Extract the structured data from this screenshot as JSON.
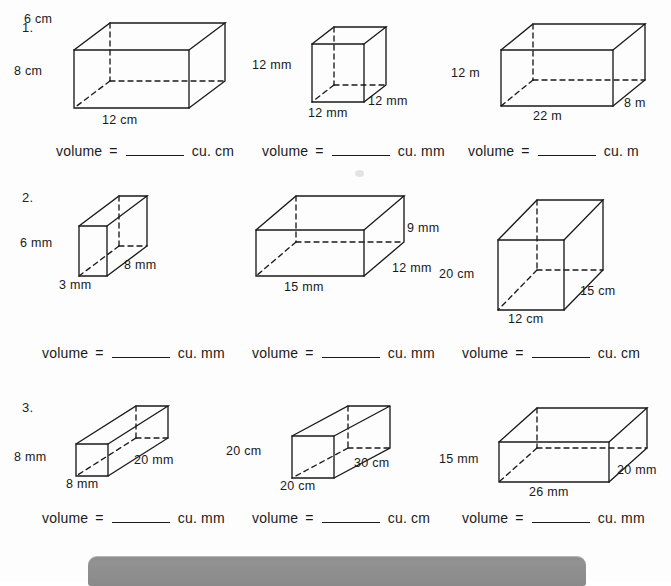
{
  "worksheet": {
    "title": "Volume of rectangular prisms worksheet",
    "ink_color": "#1a1a1a",
    "paper_color": "#fdfdfd",
    "accent_color": "#8e8e8e"
  },
  "problems": [
    {
      "number": "1.",
      "items": [
        {
          "shape": "rectangular-prism",
          "labels": {
            "height": "8 cm",
            "depth": "6 cm",
            "width": "12 cm"
          },
          "volume": {
            "word": "volume",
            "equals": "=",
            "blank": "",
            "unit": "cu. cm"
          }
        },
        {
          "shape": "cube",
          "labels": {
            "height": "12 mm",
            "depth": "12 mm",
            "width": "12 mm"
          },
          "volume": {
            "word": "volume",
            "equals": "=",
            "blank": "",
            "unit": "cu. mm"
          }
        },
        {
          "shape": "rectangular-prism",
          "labels": {
            "height": "12 m",
            "depth": "8 m",
            "width": "22 m"
          },
          "volume": {
            "word": "volume",
            "equals": "=",
            "blank": "",
            "unit": "cu. m"
          }
        }
      ]
    },
    {
      "number": "2.",
      "items": [
        {
          "shape": "rectangular-prism",
          "labels": {
            "height": "6 mm",
            "depth": "8 mm",
            "width": "3 mm"
          },
          "volume": {
            "word": "volume",
            "equals": "=",
            "blank": "",
            "unit": "cu. mm"
          }
        },
        {
          "shape": "rectangular-prism",
          "labels": {
            "height": "9 mm",
            "depth": "12 mm",
            "width": "15 mm"
          },
          "volume": {
            "word": "volume",
            "equals": "=",
            "blank": "",
            "unit": "cu. mm"
          }
        },
        {
          "shape": "rectangular-prism",
          "labels": {
            "height": "20 cm",
            "depth": "15 cm",
            "width": "12 cm"
          },
          "volume": {
            "word": "volume",
            "equals": "=",
            "blank": "",
            "unit": "cu. cm"
          }
        }
      ]
    },
    {
      "number": "3.",
      "items": [
        {
          "shape": "rectangular-prism",
          "labels": {
            "height": "8 mm",
            "depth": "20 mm",
            "width": "8 mm"
          },
          "volume": {
            "word": "volume",
            "equals": "=",
            "blank": "",
            "unit": "cu. mm"
          }
        },
        {
          "shape": "rectangular-prism",
          "labels": {
            "height": "20 cm",
            "depth": "30 cm",
            "width": "20 cm"
          },
          "volume": {
            "word": "volume",
            "equals": "=",
            "blank": "",
            "unit": "cu. cm"
          }
        },
        {
          "shape": "rectangular-prism",
          "labels": {
            "height": "15 mm",
            "depth": "20 mm",
            "width": "26 mm"
          },
          "volume": {
            "word": "volume",
            "equals": "=",
            "blank": "",
            "unit": "cu. mm"
          }
        }
      ]
    }
  ]
}
